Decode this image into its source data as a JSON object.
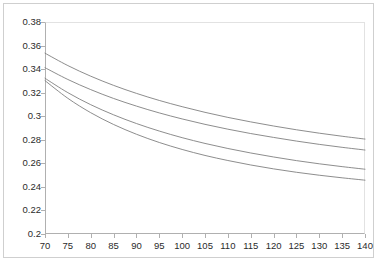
{
  "chart_data": {
    "type": "line",
    "title": "",
    "subtitle": "",
    "xlabel": "",
    "ylabel": "",
    "xlim": [
      70,
      140
    ],
    "ylim": [
      0.2,
      0.38
    ],
    "grid": false,
    "legend": null,
    "legend_position": "none",
    "background_color": "#ffffff",
    "line_color": "#808080",
    "frame_color": "#cfcfcf",
    "axis_color": "#b0b0b0",
    "y_ticks": [
      "0.38",
      "0.36",
      "0.34",
      "0.32",
      "0.3",
      "0.28",
      "0.26",
      "0.24",
      "0.22",
      "0.2"
    ],
    "y_tick_values": [
      0.38,
      0.36,
      0.34,
      0.32,
      0.3,
      0.28,
      0.26,
      0.24,
      0.22,
      0.2
    ],
    "x_ticks": [
      "70",
      "75",
      "80",
      "85",
      "90",
      "95",
      "100",
      "105",
      "110",
      "115",
      "120",
      "125",
      "130",
      "135",
      "140"
    ],
    "x_tick_values": [
      70,
      75,
      80,
      85,
      90,
      95,
      100,
      105,
      110,
      115,
      120,
      125,
      130,
      135,
      140
    ],
    "x": [
      70,
      75,
      80,
      85,
      90,
      95,
      100,
      105,
      110,
      115,
      120,
      125,
      130,
      135,
      140
    ],
    "series": [
      {
        "name": "curve-1",
        "values": [
          0.3535,
          0.343,
          0.334,
          0.3262,
          0.3194,
          0.3134,
          0.3081,
          0.3033,
          0.299,
          0.2952,
          0.2917,
          0.2885,
          0.2856,
          0.283,
          0.2806
        ]
      },
      {
        "name": "curve-2",
        "values": [
          0.3412,
          0.3312,
          0.3226,
          0.3151,
          0.3086,
          0.3028,
          0.2977,
          0.2931,
          0.289,
          0.2853,
          0.282,
          0.2789,
          0.2761,
          0.2736,
          0.2713
        ]
      },
      {
        "name": "curve-3",
        "values": [
          0.3322,
          0.32,
          0.3098,
          0.3012,
          0.2938,
          0.2874,
          0.2818,
          0.2769,
          0.2726,
          0.2688,
          0.2654,
          0.2623,
          0.2596,
          0.2572,
          0.255
        ]
      },
      {
        "name": "curve-4",
        "values": [
          0.3302,
          0.3152,
          0.303,
          0.293,
          0.2847,
          0.2777,
          0.2718,
          0.2667,
          0.2624,
          0.2586,
          0.2553,
          0.2524,
          0.2499,
          0.2477,
          0.2457
        ]
      }
    ]
  }
}
